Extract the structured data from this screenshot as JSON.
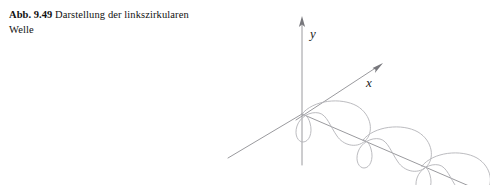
{
  "figure": {
    "caption": {
      "label": "Abb. 9.49",
      "text": "Darstellung der linkszirkularen Welle"
    },
    "background_color": "#ffffff",
    "axis_color": "#9a9a9e",
    "curve_color": "#b3b3b8",
    "label_color": "#1b1b1b"
  },
  "diagram": {
    "type": "3d-axes-helix",
    "axes": [
      {
        "name": "y",
        "label": "y",
        "direction": "up",
        "arrow": true
      },
      {
        "name": "x",
        "label": "x",
        "direction": "upper-right",
        "arrow": true
      },
      {
        "name": "z",
        "label": "",
        "direction": "lower-right",
        "arrow": false
      }
    ],
    "origin": {
      "x": 302,
      "y": 114
    },
    "helix": {
      "turns": 3,
      "handedness": "left",
      "node_points": [
        {
          "x": 302,
          "y": 114
        },
        {
          "x": 363,
          "y": 140
        },
        {
          "x": 422,
          "y": 166
        }
      ]
    }
  }
}
